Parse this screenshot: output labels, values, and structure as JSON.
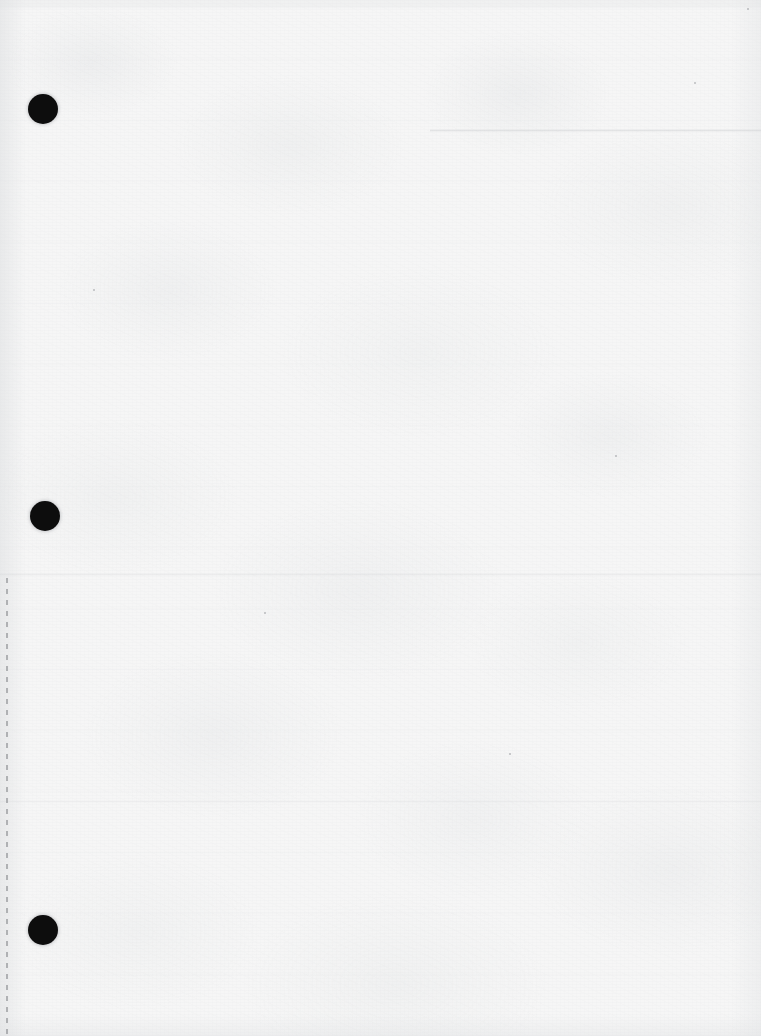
{
  "document": {
    "kind": "scanned-blank-page",
    "title": "Blank scanned loose-leaf sheet",
    "width_px": 761,
    "height_px": 1036,
    "paper_color": "#f6f6f6",
    "ink_color": "#0d0d0d",
    "visible_text": "",
    "note": "No printed or handwritten text is visible on this page."
  },
  "binder_holes": {
    "count": 3,
    "color": "#0d0d0d",
    "items": [
      {
        "label": "top-hole",
        "cx": 43,
        "cy": 109,
        "r": 15
      },
      {
        "label": "middle-hole",
        "cx": 45,
        "cy": 516,
        "r": 15
      },
      {
        "label": "bottom-hole",
        "cx": 43,
        "cy": 930,
        "r": 15
      }
    ]
  },
  "perforation": {
    "label": "tear-off perforation",
    "orientation": "vertical",
    "x": 6,
    "y_start": 578,
    "y_end": 1036,
    "color": "#96989b"
  },
  "creases": [
    {
      "label": "top-right fold line",
      "x": 430,
      "y": 129,
      "width": 331
    },
    {
      "label": "mid-page fold line",
      "x": 0,
      "y": 573,
      "width": 761
    },
    {
      "label": "lower fold line",
      "x": 0,
      "y": 800,
      "width": 761
    }
  ],
  "specks": [
    {
      "x": 93,
      "y": 289,
      "size": 2
    },
    {
      "x": 694,
      "y": 82,
      "size": 2
    },
    {
      "x": 747,
      "y": 8,
      "size": 2
    },
    {
      "x": 509,
      "y": 753,
      "size": 2
    },
    {
      "x": 615,
      "y": 455,
      "size": 2
    },
    {
      "x": 264,
      "y": 612,
      "size": 2
    }
  ]
}
